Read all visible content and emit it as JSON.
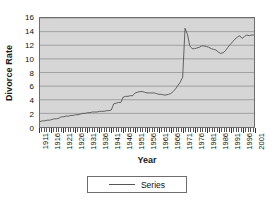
{
  "chart_data": {
    "type": "line",
    "title": "",
    "xlabel": "Year",
    "ylabel": "Divorce Rate",
    "ylim": [
      0,
      16
    ],
    "ytick_step": 2,
    "yticks": [
      0,
      2,
      4,
      6,
      8,
      10,
      12,
      14,
      16
    ],
    "xlim": [
      1911,
      2001
    ],
    "xticks": [
      1911,
      1916,
      1921,
      1926,
      1931,
      1936,
      1941,
      1946,
      1951,
      1956,
      1961,
      1966,
      1971,
      1976,
      1981,
      1986,
      1991,
      1996,
      2001
    ],
    "grid": "horizontal",
    "legend_position": "bottom-center",
    "series": [
      {
        "name": "Series",
        "color": "#555555",
        "x": [
          1911,
          1912,
          1913,
          1914,
          1915,
          1916,
          1917,
          1918,
          1919,
          1920,
          1921,
          1922,
          1923,
          1924,
          1925,
          1926,
          1927,
          1928,
          1929,
          1930,
          1931,
          1932,
          1933,
          1934,
          1935,
          1936,
          1937,
          1938,
          1939,
          1940,
          1941,
          1942,
          1943,
          1944,
          1945,
          1946,
          1947,
          1948,
          1949,
          1950,
          1951,
          1952,
          1953,
          1954,
          1955,
          1956,
          1957,
          1958,
          1959,
          1960,
          1961,
          1962,
          1963,
          1964,
          1965,
          1966,
          1967,
          1968,
          1969,
          1970,
          1971,
          1972,
          1973,
          1974,
          1975,
          1976,
          1977,
          1978,
          1979,
          1980,
          1981,
          1982,
          1983,
          1984,
          1985,
          1986,
          1987,
          1988,
          1989,
          1990,
          1991,
          1992,
          1993,
          1994,
          1995,
          1996,
          1997,
          1998,
          1999,
          2000,
          2001
        ],
        "values": [
          0.8,
          0.9,
          0.9,
          1.0,
          1.0,
          1.1,
          1.2,
          1.2,
          1.3,
          1.5,
          1.5,
          1.6,
          1.6,
          1.7,
          1.7,
          1.8,
          1.8,
          1.9,
          2.0,
          2.0,
          2.1,
          2.1,
          2.2,
          2.2,
          2.2,
          2.3,
          2.3,
          2.3,
          2.4,
          2.4,
          2.5,
          3.4,
          3.5,
          3.6,
          3.6,
          4.4,
          4.5,
          4.5,
          4.6,
          4.6,
          5.0,
          5.1,
          5.2,
          5.2,
          5.1,
          5.0,
          5.0,
          5.0,
          5.0,
          4.9,
          4.8,
          4.8,
          4.7,
          4.7,
          4.8,
          4.9,
          5.2,
          5.6,
          6.1,
          6.6,
          7.3,
          14.5,
          13.6,
          11.9,
          11.5,
          11.5,
          11.6,
          11.7,
          11.9,
          11.9,
          11.8,
          11.7,
          11.5,
          11.4,
          11.3,
          11.0,
          10.8,
          10.9,
          11.2,
          11.7,
          12.1,
          12.5,
          12.9,
          13.2,
          13.4,
          13.0,
          13.3,
          13.5,
          13.4,
          13.5,
          13.5
        ]
      }
    ]
  },
  "axis": {
    "y_title": "Divorce Rate",
    "x_title": "Year"
  },
  "legend": {
    "entries": [
      {
        "label": "Series"
      }
    ]
  }
}
